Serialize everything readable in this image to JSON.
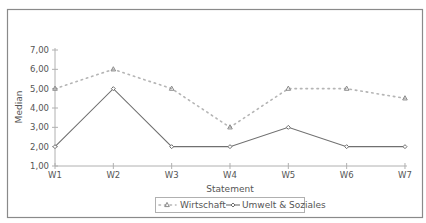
{
  "chart_data": {
    "type": "line",
    "title": "",
    "xlabel": "Statement",
    "ylabel": "Median",
    "categories": [
      "W1",
      "W2",
      "W3",
      "W4",
      "W5",
      "W6",
      "W7"
    ],
    "y_ticks": [
      "1,00",
      "2,00",
      "3,00",
      "4,00",
      "5,00",
      "6,00",
      "7,00"
    ],
    "ylim": [
      1,
      7
    ],
    "grid": false,
    "legend_position": "bottom",
    "series": [
      {
        "name": "Wirtschaft",
        "values": [
          5,
          6,
          5,
          3,
          5,
          5,
          4.5
        ],
        "style": "dotted",
        "marker": "triangle",
        "color": "#b5b5b5"
      },
      {
        "name": "Umwelt & Soziales",
        "values": [
          2,
          5,
          2,
          2,
          3,
          2,
          2
        ],
        "style": "solid",
        "marker": "diamond",
        "color": "#707070"
      }
    ]
  },
  "colors": {
    "frame": "#8a8a8a",
    "axis": "#b0b0b0",
    "text": "#555555"
  }
}
